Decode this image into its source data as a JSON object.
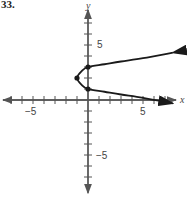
{
  "problem": {
    "number": "33."
  },
  "colors": {
    "axis": "#555555",
    "curve": "#1a1a1a",
    "text": "#444444"
  },
  "chart_data": {
    "type": "line",
    "title": "",
    "xlabel": "x",
    "ylabel": "y",
    "xlim": [
      -8,
      8
    ],
    "ylim": [
      -9,
      9
    ],
    "grid": false,
    "x_tick_labels": [
      {
        "value": -5,
        "label": "−5"
      },
      {
        "value": 5,
        "label": "5"
      }
    ],
    "y_tick_labels": [
      {
        "value": 5,
        "label": "5"
      },
      {
        "value": -5,
        "label": "−5"
      }
    ],
    "series": [
      {
        "name": "x = (y - 2)^2 - 1 (sketch)",
        "points": [
          [
            7.7,
            4.3
          ],
          [
            5,
            3.8
          ],
          [
            3,
            3.5
          ],
          [
            1.5,
            3.25
          ],
          [
            0,
            3
          ],
          [
            -0.6,
            2.6
          ],
          [
            -1,
            2
          ],
          [
            -0.6,
            1.4
          ],
          [
            0,
            1
          ],
          [
            1.5,
            0.75
          ],
          [
            3,
            0.5
          ],
          [
            5,
            0.2
          ],
          [
            7.7,
            -0.3
          ]
        ],
        "marked_points": [
          [
            0,
            3
          ],
          [
            -1,
            2
          ],
          [
            0,
            1
          ]
        ],
        "arrows_at_ends": true
      }
    ]
  },
  "labels": {
    "x_axis": "x",
    "y_axis": "y",
    "x_neg5": "−5",
    "x_pos5": "5",
    "y_pos5": "5",
    "y_neg5": "−5"
  }
}
